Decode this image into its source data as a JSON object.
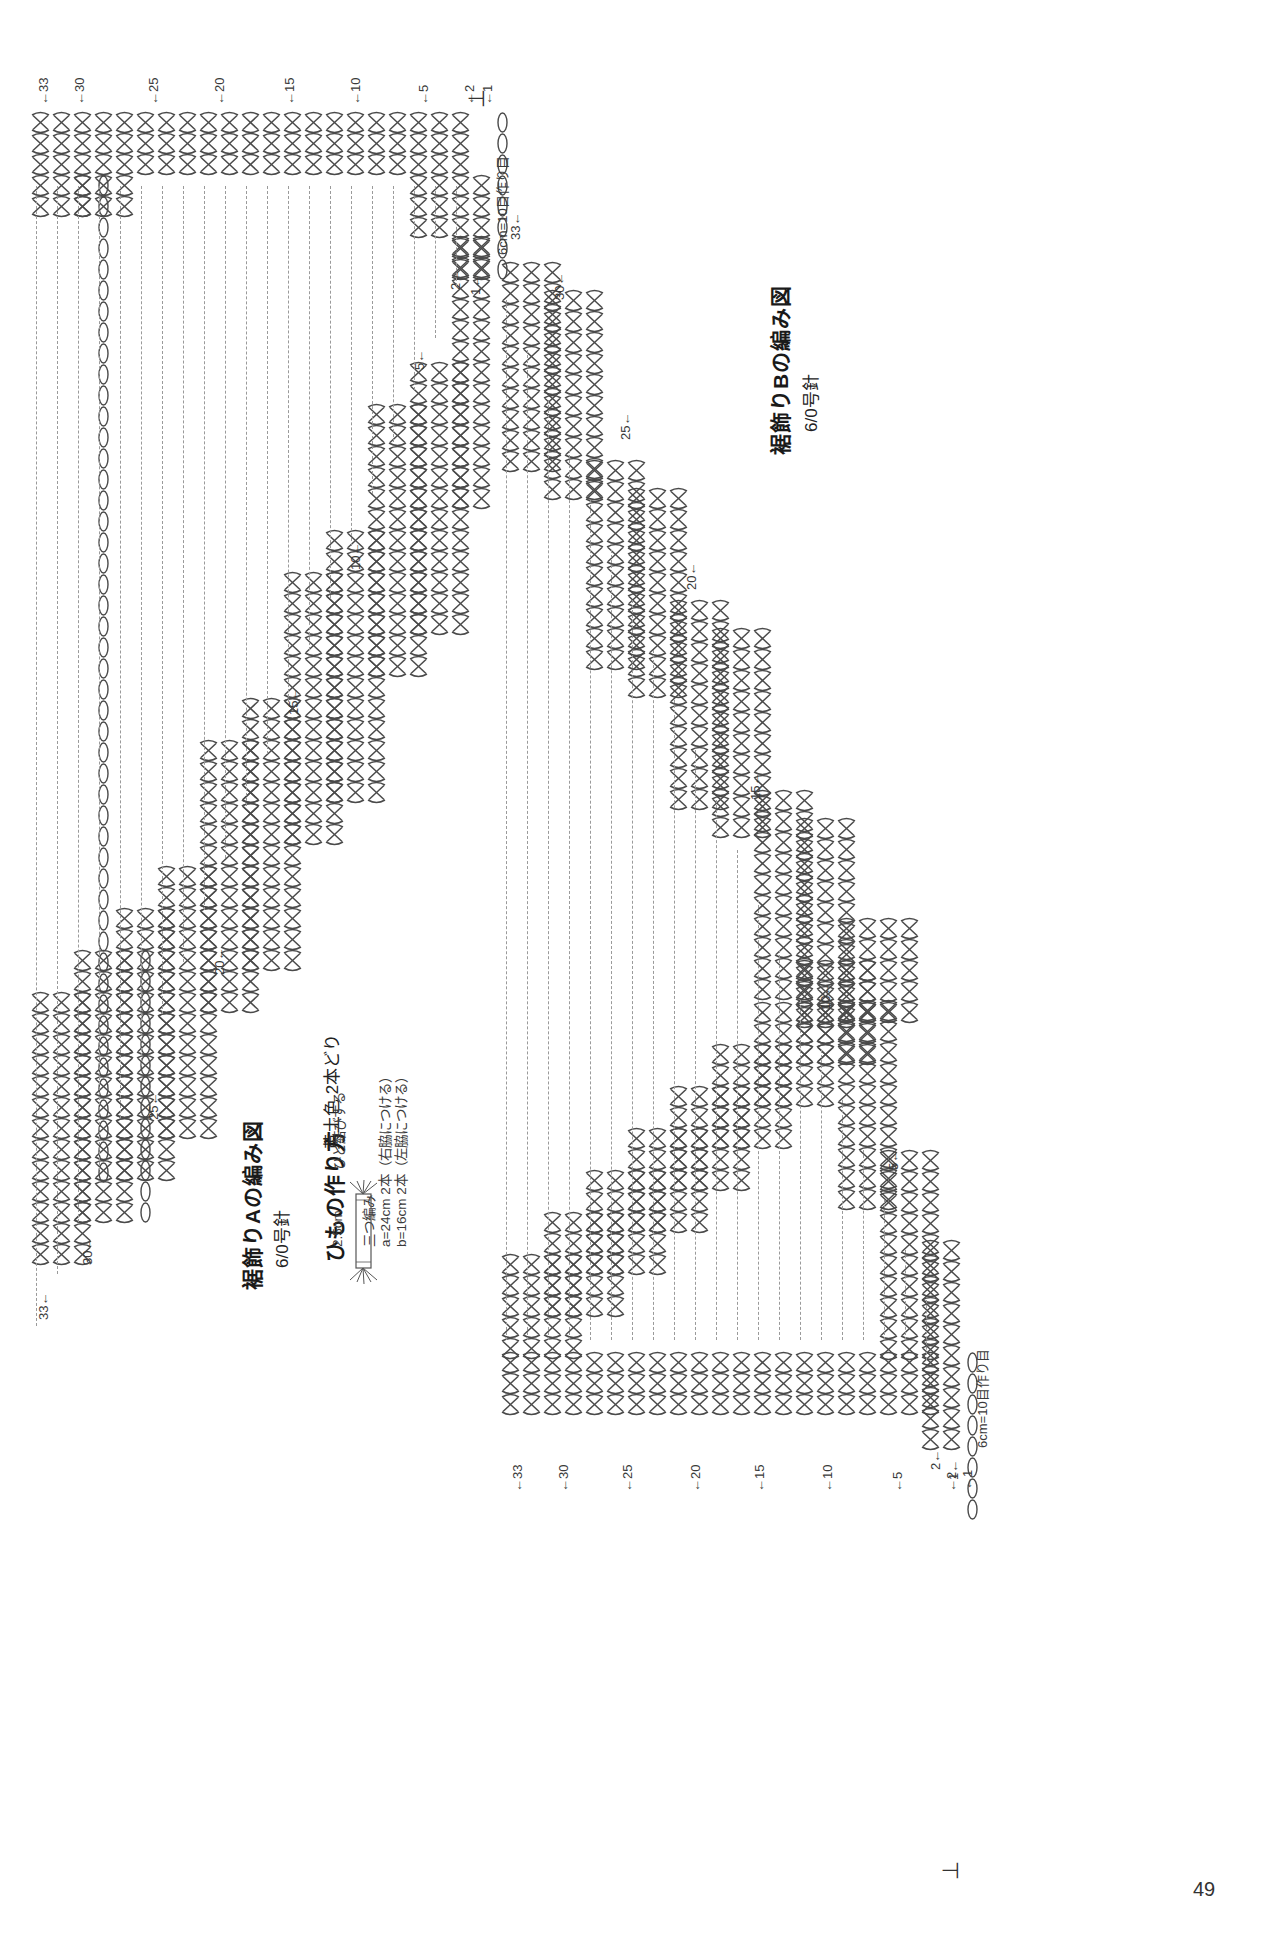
{
  "page": {
    "number": "49",
    "orientation": "rotated-90",
    "background": "#ffffff",
    "ink_color": "#3a3a3a"
  },
  "diagrams": [
    {
      "id": "hem-a",
      "title": "裾飾りAの編み図",
      "hook": "6/0号針",
      "foundation_label": "6cm=10目作り目",
      "start_marker": "⊥",
      "row_labels_right": [
        "1←",
        "2←",
        "5←",
        "10←",
        "15←",
        "20←",
        "25←",
        "30←",
        "33←"
      ],
      "row_labels_left": [
        "←1",
        "←2",
        "←5",
        "←10",
        "←15",
        "←20",
        "←25",
        "←30",
        "←33"
      ],
      "row_count": 33,
      "stitch_symbol": "cross-double-crochet",
      "steps": 9
    },
    {
      "id": "hem-b",
      "title": "裾飾りBの編み図",
      "hook": "6/0号針",
      "foundation_label": "6cm=10目作り目",
      "start_marker": "⊥",
      "row_labels_right": [
        "1←",
        "2←",
        "5←",
        "10←",
        "15←",
        "20←",
        "25←",
        "30←",
        "33←"
      ],
      "row_labels_left": [
        "←1",
        "←2",
        "←5",
        "←10",
        "←15",
        "←20",
        "←25",
        "←30",
        "←33"
      ],
      "row_count": 33,
      "stitch_symbol": "cross-double-crochet",
      "steps": 9
    }
  ],
  "cord": {
    "title": "ひもの作り方",
    "color_note": "黄土色 2本どり",
    "knot_note": "ひと結びする",
    "braid_note": "三つ編み",
    "length_a": "a=24cm 2本（右脇につける）",
    "length_b": "b=16cm 2本（左脇につける）",
    "tassel_length": "2.5cm"
  },
  "legend": {
    "arrow_up": "↑",
    "arrow_left": "←",
    "arrow_right": "→"
  }
}
